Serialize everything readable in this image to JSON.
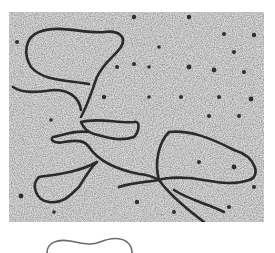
{
  "figure": {
    "micrograph": {
      "kind": "electron-micrograph",
      "subject": "DNA strands with replication loops",
      "background_color": "#c8c8c8",
      "strand_color": "#2a2a2a"
    },
    "schematic": {
      "kind": "wavy-line-diagram",
      "stroke_color": "#666666"
    }
  }
}
